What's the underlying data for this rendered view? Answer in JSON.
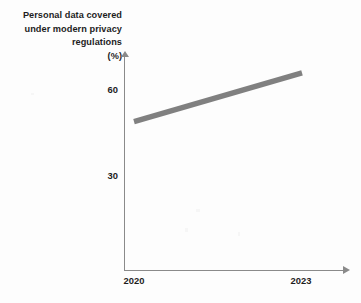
{
  "chart_data": {
    "type": "line",
    "title": "Personal data covered under modern privacy regulations (%)",
    "title_lines": [
      "Personal data covered",
      "under modern privacy",
      "regulations"
    ],
    "unit_label": "(%)",
    "xlabel": "",
    "ylabel": "(%)",
    "x": [
      2020,
      2023
    ],
    "values": [
      49,
      66
    ],
    "series": [
      {
        "name": "Personal data covered under modern privacy regulations",
        "values": [
          49,
          66
        ],
        "color": "#808080"
      }
    ],
    "categories": [
      "2020",
      "2023"
    ],
    "x_tick_labels": [
      "2020",
      "2023"
    ],
    "y_tick_labels": [
      "60",
      "30"
    ],
    "y_ticks": [
      60,
      30
    ],
    "ylim": [
      0,
      72
    ],
    "xlim": [
      2020,
      2023.7
    ],
    "grid": false,
    "legend": false,
    "legend_position": "none",
    "axis_color": "#8a8a8a",
    "text_color": "#1d1d1d",
    "background": "#fdfdfd"
  },
  "axes": {
    "y_ticks": [
      {
        "label": "60",
        "value": 60
      },
      {
        "label": "30",
        "value": 30
      }
    ],
    "x_ticks": [
      {
        "label": "2020",
        "value": 2020
      },
      {
        "label": "2023",
        "value": 2023
      }
    ]
  }
}
